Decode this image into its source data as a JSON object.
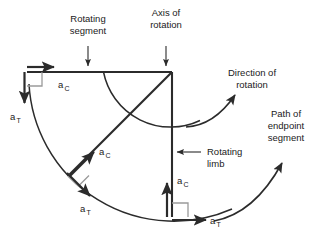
{
  "figure": {
    "colors": {
      "line": "#2b2b2b",
      "right_angle": "#9a9a9a",
      "text": "#1a1a1a",
      "background": "#ffffff"
    },
    "pivot": {
      "x": 172,
      "y": 72,
      "radius": 145
    }
  },
  "annotations": {
    "rotating_segment": {
      "line1": "Rotating",
      "line2": "segment"
    },
    "axis_of_rotation": {
      "line1": "Axis of",
      "line2": "rotation"
    },
    "direction_of_rotation": {
      "line1": "Direction of",
      "line2": "rotation"
    },
    "path_of_endpoint_segment": {
      "line1": "Path of",
      "line2": "endpoint",
      "line3": "segment"
    },
    "rotating_limb": {
      "line1": "Rotating",
      "line2": "limb"
    }
  },
  "vectors": {
    "symbol": "a",
    "centripetal_subscript": "C",
    "tangential_subscript": "T",
    "positions": [
      {
        "name": "top-left-endpoint",
        "centripetal_label": "a",
        "centripetal_sub": "C",
        "tangential_label": "a",
        "tangential_sub": "T",
        "centripetal_direction": "right",
        "tangential_direction": "down"
      },
      {
        "name": "mid-diagonal-endpoint",
        "centripetal_label": "a",
        "centripetal_sub": "C",
        "tangential_label": "a",
        "tangential_sub": "T",
        "centripetal_direction": "up-right",
        "tangential_direction": "down-right"
      },
      {
        "name": "bottom-endpoint",
        "centripetal_label": "a",
        "centripetal_sub": "C",
        "tangential_label": "a",
        "tangential_sub": "T",
        "centripetal_direction": "up",
        "tangential_direction": "right"
      }
    ]
  }
}
